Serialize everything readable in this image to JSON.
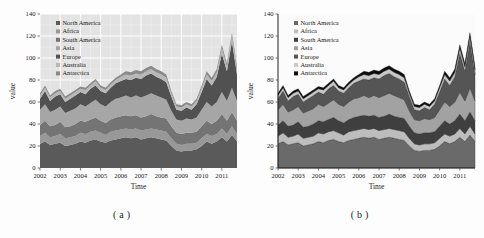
{
  "figure": {
    "captions": {
      "a": "(a)",
      "b": "(b)"
    }
  },
  "chart_data": [
    {
      "type": "area",
      "stacked": true,
      "panel": "a",
      "xlabel": "Time",
      "ylabel": "value",
      "xlim": [
        2002,
        2011.75
      ],
      "ylim": [
        0,
        140
      ],
      "yticks": [
        0,
        20,
        40,
        60,
        80,
        100,
        120,
        140
      ],
      "xticks": [
        2002,
        2003,
        2004,
        2005,
        2006,
        2007,
        2008,
        2009,
        2010,
        2011
      ],
      "grid": true,
      "spines": false,
      "panel_bg": "#e3e3e3",
      "grid_color": "#ffffff",
      "series_stroke": "none",
      "legend_position": "top-left",
      "x": [
        2002,
        2002.25,
        2002.5,
        2002.75,
        2003,
        2003.25,
        2003.5,
        2003.75,
        2004,
        2004.25,
        2004.5,
        2004.75,
        2005,
        2005.25,
        2005.5,
        2005.75,
        2006,
        2006.25,
        2006.5,
        2006.75,
        2007,
        2007.25,
        2007.5,
        2007.75,
        2008,
        2008.25,
        2008.5,
        2008.75,
        2009,
        2009.25,
        2009.5,
        2009.75,
        2010,
        2010.25,
        2010.5,
        2010.75,
        2011,
        2011.25,
        2011.5,
        2011.75
      ],
      "series": [
        {
          "name": "North America",
          "color": "#5a5a5a",
          "values": [
            22,
            24,
            21,
            22,
            23,
            20,
            21,
            22,
            24,
            23,
            25,
            26,
            24,
            23,
            25,
            26,
            27,
            28,
            27,
            28,
            26,
            27,
            28,
            27,
            26,
            25,
            20,
            16,
            15,
            16,
            16,
            17,
            20,
            24,
            22,
            24,
            28,
            24,
            30,
            24
          ]
        },
        {
          "name": "Africa",
          "color": "#989898",
          "values": [
            7,
            8,
            7,
            7,
            8,
            7,
            7,
            7,
            8,
            8,
            8,
            8,
            8,
            7,
            8,
            8,
            8,
            8,
            8,
            8,
            8,
            8,
            8,
            8,
            8,
            8,
            7,
            6,
            6,
            6,
            6,
            6,
            7,
            7,
            7,
            7,
            8,
            7,
            8,
            7
          ]
        },
        {
          "name": "South America",
          "color": "#747474",
          "values": [
            10,
            11,
            10,
            10,
            11,
            10,
            10,
            11,
            11,
            11,
            11,
            12,
            11,
            11,
            11,
            12,
            12,
            12,
            12,
            12,
            12,
            12,
            13,
            12,
            12,
            12,
            11,
            10,
            10,
            10,
            10,
            10,
            11,
            12,
            11,
            12,
            13,
            12,
            13,
            12
          ]
        },
        {
          "name": "Asia",
          "color": "#a6a6a6",
          "values": [
            14,
            15,
            13,
            14,
            14,
            13,
            14,
            14,
            15,
            14,
            15,
            16,
            15,
            15,
            16,
            17,
            17,
            18,
            17,
            18,
            18,
            19,
            19,
            19,
            18,
            17,
            14,
            12,
            12,
            13,
            12,
            13,
            15,
            17,
            16,
            17,
            20,
            18,
            22,
            18
          ]
        },
        {
          "name": "Europe",
          "color": "#515151",
          "values": [
            10,
            12,
            10,
            12,
            11,
            10,
            11,
            12,
            11,
            11,
            13,
            13,
            12,
            12,
            13,
            14,
            15,
            15,
            16,
            16,
            17,
            18,
            18,
            17,
            17,
            16,
            13,
            9,
            9,
            10,
            9,
            12,
            16,
            21,
            19,
            23,
            35,
            27,
            42,
            24
          ]
        },
        {
          "name": "Australia",
          "color": "#b8b8b8",
          "values": [
            3,
            3,
            3,
            3,
            3,
            3,
            3,
            3,
            3,
            4,
            3,
            4,
            3,
            3,
            3,
            3,
            4,
            4,
            4,
            4,
            4,
            4,
            4,
            4,
            4,
            4,
            3,
            3,
            3,
            3,
            3,
            3,
            4,
            4,
            4,
            4,
            5,
            4,
            5,
            4
          ]
        },
        {
          "name": "Antarctica",
          "color": "#8a8a8a",
          "values": [
            2,
            2,
            2,
            2,
            2,
            2,
            2,
            2,
            2,
            2,
            2,
            2,
            2,
            2,
            2,
            2,
            2,
            3,
            3,
            3,
            3,
            3,
            3,
            3,
            3,
            3,
            2,
            2,
            2,
            2,
            2,
            2,
            2,
            3,
            3,
            3,
            3,
            3,
            3,
            3
          ]
        }
      ]
    },
    {
      "type": "area",
      "stacked": true,
      "panel": "b",
      "xlabel": "Time",
      "ylabel": "value",
      "xlim": [
        2002,
        2011.75
      ],
      "ylim": [
        0,
        140
      ],
      "yticks": [
        0,
        20,
        40,
        60,
        80,
        100,
        120,
        140
      ],
      "xticks": [
        2002,
        2003,
        2004,
        2005,
        2006,
        2007,
        2008,
        2009,
        2010,
        2011
      ],
      "grid": false,
      "spines": true,
      "panel_bg": "#fbfbfb",
      "grid_color": "#ffffff",
      "series_stroke": "#2a2a2a",
      "legend_position": "top-left",
      "x": [
        2002,
        2002.25,
        2002.5,
        2002.75,
        2003,
        2003.25,
        2003.5,
        2003.75,
        2004,
        2004.25,
        2004.5,
        2004.75,
        2005,
        2005.25,
        2005.5,
        2005.75,
        2006,
        2006.25,
        2006.5,
        2006.75,
        2007,
        2007.25,
        2007.5,
        2007.75,
        2008,
        2008.25,
        2008.5,
        2008.75,
        2009,
        2009.25,
        2009.5,
        2009.75,
        2010,
        2010.25,
        2010.5,
        2010.75,
        2011,
        2011.25,
        2011.5,
        2011.75
      ],
      "series": [
        {
          "name": "North America",
          "color": "#6a6a6a",
          "values": [
            22,
            24,
            21,
            22,
            23,
            20,
            21,
            22,
            24,
            23,
            25,
            26,
            24,
            23,
            25,
            26,
            27,
            28,
            27,
            28,
            26,
            27,
            28,
            27,
            26,
            25,
            20,
            16,
            15,
            16,
            16,
            17,
            20,
            24,
            22,
            24,
            28,
            24,
            30,
            24
          ]
        },
        {
          "name": "Africa",
          "color": "#bdbdbd",
          "values": [
            7,
            8,
            7,
            7,
            8,
            7,
            7,
            7,
            8,
            8,
            8,
            8,
            8,
            7,
            8,
            8,
            8,
            8,
            8,
            8,
            8,
            8,
            8,
            8,
            8,
            8,
            7,
            6,
            6,
            6,
            6,
            6,
            7,
            7,
            7,
            7,
            8,
            7,
            8,
            7
          ]
        },
        {
          "name": "South America",
          "color": "#3f3f3f",
          "values": [
            10,
            11,
            10,
            10,
            11,
            10,
            10,
            11,
            11,
            11,
            11,
            12,
            11,
            11,
            11,
            12,
            12,
            12,
            12,
            12,
            12,
            12,
            13,
            12,
            12,
            12,
            11,
            10,
            10,
            10,
            10,
            10,
            11,
            12,
            11,
            12,
            13,
            12,
            13,
            12
          ]
        },
        {
          "name": "Asia",
          "color": "#a2a2a2",
          "values": [
            14,
            15,
            13,
            14,
            14,
            13,
            14,
            14,
            15,
            14,
            15,
            16,
            15,
            15,
            16,
            17,
            17,
            18,
            17,
            18,
            18,
            19,
            19,
            19,
            18,
            17,
            14,
            12,
            12,
            13,
            12,
            13,
            15,
            17,
            16,
            17,
            20,
            18,
            22,
            18
          ]
        },
        {
          "name": "Europe",
          "color": "#555555",
          "values": [
            10,
            12,
            10,
            12,
            11,
            10,
            11,
            12,
            11,
            11,
            13,
            13,
            12,
            12,
            13,
            14,
            15,
            15,
            16,
            16,
            17,
            18,
            18,
            17,
            17,
            16,
            13,
            9,
            9,
            10,
            9,
            12,
            16,
            21,
            19,
            23,
            35,
            27,
            42,
            24
          ]
        },
        {
          "name": "Australia",
          "color": "#c9c9c9",
          "values": [
            3,
            3,
            3,
            3,
            3,
            3,
            3,
            3,
            3,
            4,
            3,
            4,
            3,
            3,
            3,
            3,
            4,
            4,
            4,
            4,
            4,
            4,
            4,
            4,
            4,
            4,
            3,
            3,
            3,
            3,
            3,
            3,
            4,
            4,
            4,
            4,
            5,
            4,
            5,
            4
          ]
        },
        {
          "name": "Antarctica",
          "color": "#0d0d0d",
          "values": [
            2,
            2,
            2,
            2,
            2,
            2,
            2,
            2,
            2,
            2,
            2,
            2,
            2,
            2,
            2,
            2,
            2,
            3,
            3,
            3,
            3,
            3,
            3,
            3,
            3,
            3,
            2,
            2,
            2,
            2,
            2,
            2,
            2,
            3,
            3,
            3,
            3,
            3,
            3,
            3
          ]
        }
      ]
    }
  ]
}
